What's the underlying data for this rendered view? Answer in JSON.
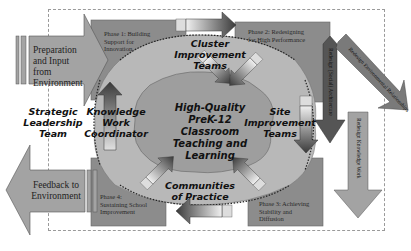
{
  "diagram": {
    "left_inputs": {
      "input_arrow": "Preparation and Input from Environment",
      "feedback_arrow": "Feedback to Environment",
      "strategic_team": [
        "Strategic",
        "Leadership",
        "Team"
      ]
    },
    "phases": {
      "phase1": [
        "Phase 1: Building",
        "Support for",
        "Innovation"
      ],
      "phase2": [
        "Phase 2: Redesigning",
        "for High Performance"
      ],
      "phase3": [
        "Phase 3: Achieving",
        "Stability and",
        "Diffusion"
      ],
      "phase4": [
        "Phase 4:",
        "Sustaining School",
        "Improvement"
      ]
    },
    "teams": {
      "cluster": [
        "Cluster",
        "Improvement",
        "Teams"
      ],
      "site": [
        "Site",
        "Improvement",
        "Teams"
      ],
      "knowledge": [
        "Knowledge",
        "Work",
        "Coordinator"
      ],
      "communities": [
        "Communities",
        "of Practice"
      ]
    },
    "center": [
      "High-Quality",
      "PreK-12",
      "Classroom",
      "Teaching and",
      "Learning"
    ],
    "right_arrows": {
      "social": "Redesign (Social) Architecture",
      "environmental": "Redesign Environmental Relationships",
      "knowledge": "Redesign Knowledge Work"
    },
    "colors": {
      "phase_fill": "#8c8c8c",
      "arrow_fill": "#a3a3a3",
      "gear_fill": "#b8b8b8",
      "center_fill": "#9e9e9e",
      "dark_arrow": "#555555"
    }
  }
}
